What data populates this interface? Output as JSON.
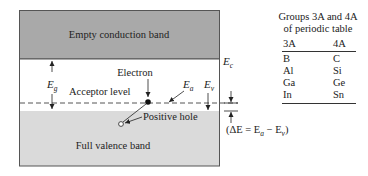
{
  "diagram": {
    "conduction_band_label": "Empty conduction band",
    "valence_band_label": "Full valence band",
    "acceptor_level_label": "Acceptor level",
    "electron_label": "Electron",
    "hole_label": "Positive hole",
    "Eg": {
      "main": "E",
      "sub": "g"
    },
    "Ec": {
      "main": "E",
      "sub": "c"
    },
    "Ea": {
      "main": "E",
      "sub": "a"
    },
    "Ev": {
      "main": "E",
      "sub": "v"
    },
    "delta_e": {
      "open": "(ΔE = E",
      "sub_a": "a",
      "minus": " − E",
      "sub_v": "v",
      "close": ")"
    },
    "colors": {
      "conduction_band": "#a9a9a9",
      "valence_band": "#dadada",
      "border": "#555555",
      "text": "#222222"
    }
  },
  "periodic_table": {
    "title_line1": "Groups 3A and 4A",
    "title_line2": "of periodic table",
    "headers": [
      "3A",
      "4A"
    ],
    "rows": [
      [
        "B",
        "C"
      ],
      [
        "Al",
        "Si"
      ],
      [
        "Ga",
        "Ge"
      ],
      [
        "In",
        "Sn"
      ]
    ]
  }
}
